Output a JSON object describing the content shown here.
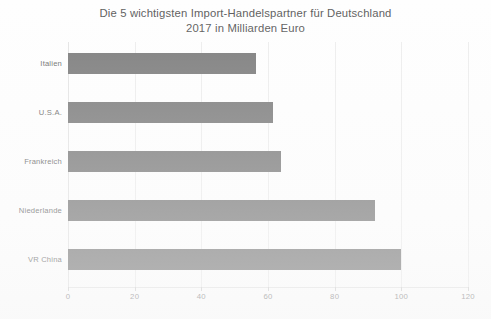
{
  "chart_data": {
    "type": "bar",
    "orientation": "horizontal",
    "title": "Die 5 wichtigsten Import-Handelspartner für Deutschland",
    "subtitle": "2017 in Milliarden Euro",
    "title_lines": [
      "Die 5 wichtigsten Import-Handelspartner für Deutschland",
      "2017 in Milliarden Euro"
    ],
    "categories": [
      "Italien",
      "U.S.A.",
      "Frankreich",
      "Niederlande",
      "VR China"
    ],
    "values": [
      56.5,
      61.5,
      64.0,
      92.0,
      100.0
    ],
    "xlabel": "",
    "ylabel": "",
    "xlim": [
      0,
      120
    ],
    "xticks": [
      0,
      20,
      40,
      60,
      80,
      100,
      120
    ],
    "xtick_labels": [
      "0",
      "20",
      "40",
      "60",
      "80",
      "100",
      "120"
    ],
    "grid": true,
    "grid_axis": "x",
    "legend": false,
    "bar_color": "#7e7e7e",
    "text_color": "#6d6d6d",
    "title_color": "#5e5e5e",
    "gridline_color": "#ededed",
    "background_color": "#fefefe"
  }
}
